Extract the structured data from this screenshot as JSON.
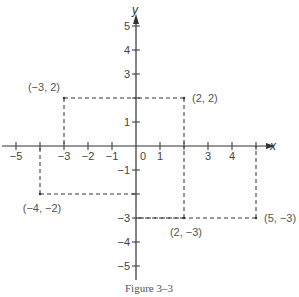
{
  "figure": {
    "caption": "Figure 3–3",
    "x_axis_label": "x",
    "y_axis_label": "y",
    "origin_label": "0",
    "colors": {
      "ink": "#333333",
      "label": "#555555",
      "background": "#ffffff"
    }
  },
  "chart_data": {
    "type": "scatter",
    "title": "Figure 3–3",
    "xlabel": "x",
    "ylabel": "y",
    "xlim": [
      -5,
      5
    ],
    "ylim": [
      -5,
      5
    ],
    "x_ticks": [
      -5,
      -3,
      -2,
      -1,
      1,
      3,
      4
    ],
    "x_tick_marks": [
      -5,
      -4,
      -3,
      -2,
      -1,
      1,
      2,
      3,
      4,
      5
    ],
    "y_ticks": [
      5,
      4,
      3,
      1,
      -1,
      -3,
      -4,
      -5
    ],
    "y_tick_marks": [
      5,
      4,
      3,
      2,
      1,
      -1,
      -2,
      -3,
      -4,
      -5
    ],
    "grid": false,
    "points": [
      {
        "x": -3,
        "y": 2,
        "label": "(−3, 2)"
      },
      {
        "x": 2,
        "y": 2,
        "label": "(2, 2)"
      },
      {
        "x": -4,
        "y": -2,
        "label": "(−4, −2)"
      },
      {
        "x": 2,
        "y": -3,
        "label": "(2, −3)"
      },
      {
        "x": 5,
        "y": -3,
        "label": "(5, −3)"
      }
    ],
    "projection_lines": "dashed lines from each point to the axes"
  }
}
